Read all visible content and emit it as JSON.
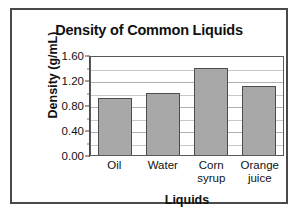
{
  "chart_data": {
    "type": "bar",
    "title": "Density of Common Liquids",
    "xlabel": "Liquids",
    "ylabel": "Density (g/mL)",
    "categories": [
      "Oil",
      "Water",
      "Corn syrup",
      "Orange juice"
    ],
    "category_lines": [
      [
        "Oil"
      ],
      [
        "Water"
      ],
      [
        "Corn",
        "syrup"
      ],
      [
        "Orange",
        "juice"
      ]
    ],
    "values": [
      0.92,
      1.0,
      1.4,
      1.1
    ],
    "ylim": [
      0.0,
      1.6
    ],
    "ytick_labels": [
      "0.00",
      "0.40",
      "0.80",
      "1.20",
      "1.60"
    ],
    "ytick_values": [
      0.0,
      0.4,
      0.8,
      1.2,
      1.6
    ],
    "minor_gridline_values": [
      0.2,
      0.6,
      1.0,
      1.4
    ],
    "grid": true,
    "legend": "none",
    "bar_color": "#a8a8a8",
    "bar_edge_color": "#4d4d4d",
    "plot_background": "#ffffff",
    "frame_color": "#4a4a4a"
  }
}
